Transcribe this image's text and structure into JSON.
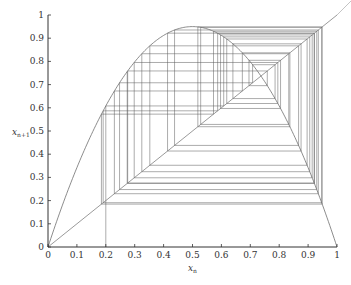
{
  "chart_data": {
    "type": "line",
    "title": "",
    "xlabel": "x_n",
    "ylabel": "x_{n+1}",
    "xlim": [
      0,
      1
    ],
    "ylim": [
      0,
      1
    ],
    "grid": false,
    "legend": null,
    "x_ticks": [
      "0",
      "0.1",
      "0.2",
      "0.3",
      "0.4",
      "0.5",
      "0.6",
      "0.7",
      "0.8",
      "0.9",
      "1"
    ],
    "y_ticks": [
      "0",
      "0.1",
      "0.2",
      "0.3",
      "0.4",
      "0.5",
      "0.6",
      "0.7",
      "0.8",
      "0.9",
      "1"
    ],
    "series": [
      {
        "name": "logistic curve",
        "kind": "function",
        "formula": "x_{n+1} = r x_n (1 - x_n)",
        "r": 3.8,
        "peak": {
          "x": 0.5,
          "y": 0.95
        }
      },
      {
        "name": "identity line",
        "kind": "function",
        "formula": "x_{n+1} = x_n",
        "x": [
          0,
          1
        ],
        "y": [
          0,
          1
        ]
      },
      {
        "name": "cobweb iterates",
        "kind": "cobweb",
        "x0": 0.2,
        "values": [
          0.2,
          0.608,
          0.9057,
          0.3246,
          0.8331,
          0.5283,
          0.9469,
          0.1909,
          0.587,
          0.9213,
          0.2757,
          0.7588,
          0.6955,
          0.8047,
          0.5971,
          0.9141,
          0.2983,
          0.7953,
          0.6185,
          0.8966,
          0.3523,
          0.8671,
          0.4379,
          0.9354,
          0.2297,
          0.6725,
          0.837,
          0.5185,
          0.9487,
          0.1849,
          0.5727,
          0.9299,
          0.2476,
          0.7079,
          0.7857,
          0.6398,
          0.8757,
          0.4137,
          0.9217,
          0.2741,
          0.7562
        ]
      }
    ]
  },
  "axes": {
    "xlabel_main": "x",
    "xlabel_sub": "n",
    "ylabel_main": "x",
    "ylabel_sub": "n+1"
  },
  "colors": {
    "axis": "#333333",
    "curve": "#6e6e6e",
    "cobweb": "#5a5a5a"
  }
}
